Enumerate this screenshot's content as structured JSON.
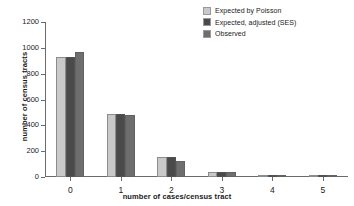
{
  "chart_data": {
    "type": "bar",
    "title": "",
    "xlabel": "number of cases/census tract",
    "ylabel": "number of census tracts",
    "categories": [
      "0",
      "1",
      "2",
      "3",
      "4",
      "5"
    ],
    "series": [
      {
        "name": "Expected by Poisson",
        "color": "#c9c9c9",
        "values": [
          929,
          487,
          156,
          40,
          8,
          1
        ]
      },
      {
        "name": "Expected, adjusted (SES)",
        "color": "#4a4a4a",
        "values": [
          929,
          487,
          158,
          38,
          11,
          1
        ]
      },
      {
        "name": "Observed",
        "color": "#6e6e6e",
        "values": [
          971,
          481,
          122,
          37,
          10,
          1
        ]
      }
    ],
    "ylim": [
      0,
      1200
    ],
    "yticks": [
      0,
      200,
      400,
      600,
      800,
      1000,
      1200
    ],
    "ytick_labels": [
      "0",
      "200",
      "400",
      "600",
      "800",
      "1000",
      "1200"
    ],
    "grid": false,
    "legend_position": "top-right",
    "axis_color": "#6b6b6b",
    "background": "#ffffff"
  }
}
